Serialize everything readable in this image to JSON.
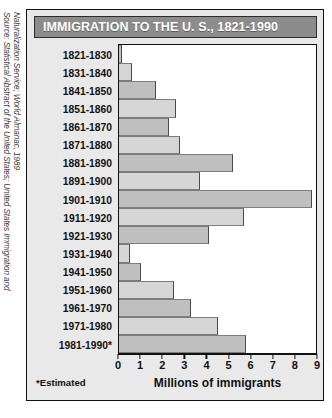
{
  "title": "IMMIGRATION TO THE U. S., 1821-1990",
  "source": {
    "line1": "Source: Statistical Abstract of the United States; United States Immigration and",
    "line2": "Naturalization Service; World Almanac, 1989"
  },
  "footnote": "*Estimated",
  "colors": {
    "banner_bg": "#8c8c8c",
    "banner_text": "#ffffff",
    "figure_bg": "#e9e9e9",
    "plot_bg": "#ffffff",
    "bar_dark": "#bfbfbf",
    "bar_light": "#d6d6d6",
    "frame": "#111111"
  },
  "chart_data": {
    "type": "bar",
    "orientation": "horizontal",
    "title": "IMMIGRATION TO THE U. S., 1821-1990",
    "xlabel": "Millions of immigrants",
    "ylabel": "",
    "xlim": [
      0,
      9
    ],
    "xticks": [
      0,
      1,
      2,
      3,
      4,
      5,
      6,
      7,
      8,
      9
    ],
    "xticklabels": [
      "0",
      "1",
      "2",
      "3",
      "4",
      "5",
      "6",
      "7",
      "8",
      "9"
    ],
    "grid": false,
    "legend": "none",
    "units": "millions of immigrants",
    "categories": [
      "1821-1830",
      "1831-1840",
      "1841-1850",
      "1851-1860",
      "1861-1870",
      "1871-1880",
      "1881-1890",
      "1891-1900",
      "1901-1910",
      "1911-1920",
      "1921-1930",
      "1931-1940",
      "1941-1950",
      "1951-1960",
      "1961-1970",
      "1971-1980",
      "1981-1990*"
    ],
    "values": [
      0.15,
      0.6,
      1.7,
      2.6,
      2.3,
      2.8,
      5.2,
      3.7,
      8.8,
      5.7,
      4.1,
      0.5,
      1.0,
      2.5,
      3.3,
      4.5,
      5.8
    ],
    "annotations": [
      "*Estimated"
    ]
  }
}
